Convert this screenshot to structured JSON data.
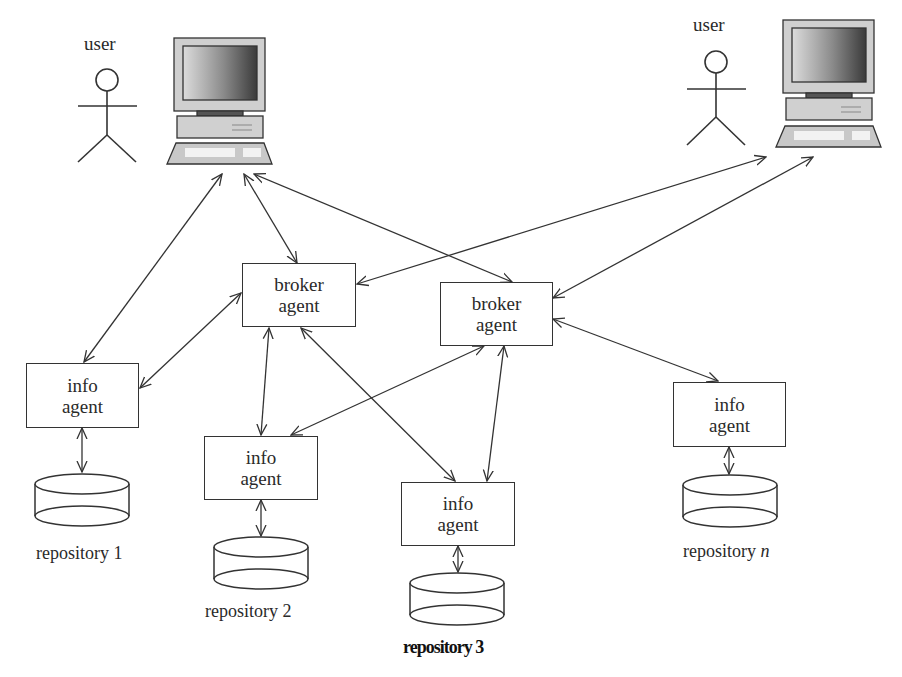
{
  "diagram": {
    "type": "multi-agent information architecture",
    "users": [
      {
        "id": "user1",
        "label": "user"
      },
      {
        "id": "user2",
        "label": "user"
      }
    ],
    "computers": [
      {
        "id": "computer1"
      },
      {
        "id": "computer2"
      }
    ],
    "broker_agents": [
      {
        "id": "broker1",
        "line1": "broker",
        "line2": "agent"
      },
      {
        "id": "broker2",
        "line1": "broker",
        "line2": "agent"
      }
    ],
    "info_agents": [
      {
        "id": "info1",
        "line1": "info",
        "line2": "agent"
      },
      {
        "id": "info2",
        "line1": "info",
        "line2": "agent"
      },
      {
        "id": "info3",
        "line1": "info",
        "line2": "agent"
      },
      {
        "id": "infoN",
        "line1": "info",
        "line2": "agent"
      }
    ],
    "repositories": [
      {
        "id": "repo1",
        "label": "repository 1"
      },
      {
        "id": "repo2",
        "label": "repository 2"
      },
      {
        "id": "repo3",
        "label": "repository 3"
      },
      {
        "id": "repoN",
        "label_prefix": "repository ",
        "label_suffix": "n"
      }
    ],
    "edges": [
      {
        "from": "computer1",
        "to": "info1",
        "bidirectional": true
      },
      {
        "from": "computer1",
        "to": "broker1",
        "bidirectional": true
      },
      {
        "from": "computer1",
        "to": "broker2",
        "bidirectional": true
      },
      {
        "from": "computer2",
        "to": "broker1",
        "bidirectional": true
      },
      {
        "from": "computer2",
        "to": "broker2",
        "bidirectional": true
      },
      {
        "from": "broker1",
        "to": "info1",
        "bidirectional": true
      },
      {
        "from": "broker1",
        "to": "info2",
        "bidirectional": true
      },
      {
        "from": "broker1",
        "to": "info3",
        "bidirectional": true
      },
      {
        "from": "broker2",
        "to": "info2",
        "bidirectional": true
      },
      {
        "from": "broker2",
        "to": "info3",
        "bidirectional": true
      },
      {
        "from": "broker2",
        "to": "infoN",
        "bidirectional": true
      },
      {
        "from": "info1",
        "to": "repo1",
        "bidirectional": true
      },
      {
        "from": "info2",
        "to": "repo2",
        "bidirectional": true
      },
      {
        "from": "info3",
        "to": "repo3",
        "bidirectional": true
      },
      {
        "from": "infoN",
        "to": "repoN",
        "bidirectional": true
      }
    ]
  },
  "colors": {
    "stroke": "#333333",
    "monitor_frame": "#c8c8c8",
    "screen_dark": "#4a4a4a",
    "screen_light": "#d8d8d8",
    "background": "#ffffff"
  }
}
